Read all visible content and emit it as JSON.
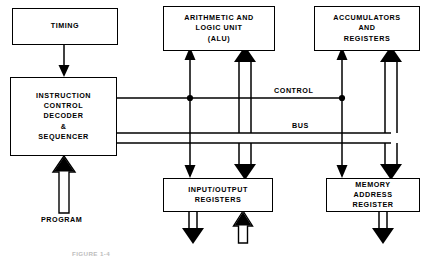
{
  "figure": {
    "caption": "FIGURE 1-4",
    "line_color": "#000000",
    "background": "#ffffff"
  },
  "blocks": {
    "timing": {
      "lines": [
        "TIMING"
      ]
    },
    "alu": {
      "lines": [
        "ARITHMETIC AND",
        "LOGIC UNIT",
        "(ALU)"
      ]
    },
    "accumulators": {
      "lines": [
        "ACCUMULATORS",
        "AND",
        "REGISTERS"
      ]
    },
    "instruction": {
      "lines": [
        "INSTRUCTION",
        "CONTROL",
        "DECODER",
        "&",
        "SEQUENCER"
      ]
    },
    "io": {
      "lines": [
        "INPUT/OUTPUT",
        "REGISTERS"
      ]
    },
    "mar": {
      "lines": [
        "MEMORY",
        "ADDRESS",
        "REGISTER"
      ]
    }
  },
  "wire_labels": {
    "control": "CONTROL",
    "bus": "BUS",
    "program": "PROGRAM"
  }
}
